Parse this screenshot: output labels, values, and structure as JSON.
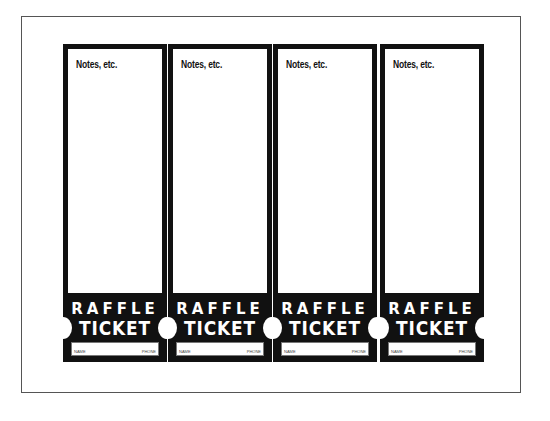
{
  "tickets": [
    {
      "notes_label": "Notes, etc.",
      "title_line1": "RAFFLE",
      "title_line2": "TICKET",
      "field_left": "NAME",
      "field_right": "PHONE"
    },
    {
      "notes_label": "Notes, etc.",
      "title_line1": "RAFFLE",
      "title_line2": "TICKET",
      "field_left": "NAME",
      "field_right": "PHONE"
    },
    {
      "notes_label": "Notes, etc.",
      "title_line1": "RAFFLE",
      "title_line2": "TICKET",
      "field_left": "NAME",
      "field_right": "PHONE"
    },
    {
      "notes_label": "Notes, etc.",
      "title_line1": "RAFFLE",
      "title_line2": "TICKET",
      "field_left": "NAME",
      "field_right": "PHONE"
    }
  ],
  "colors": {
    "ticket_black": "#111111",
    "page_border": "#555555",
    "background": "#ffffff"
  }
}
